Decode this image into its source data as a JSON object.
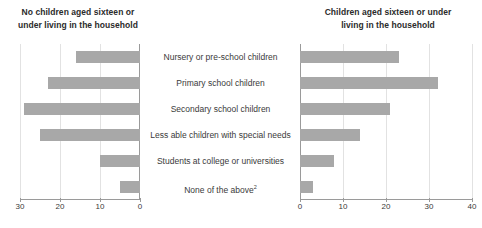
{
  "panels": {
    "left": {
      "title": "No children aged sixteen or under living in the household",
      "title_line1": "No children aged sixteen or",
      "title_line2": "under living in the household",
      "axis_ticks": [
        "30",
        "20",
        "10",
        "0"
      ]
    },
    "right": {
      "title": "Children aged sixteen or under living in the household",
      "title_line1": "Children aged sixteen or under",
      "title_line2": "living in the household",
      "axis_ticks": [
        "0",
        "10",
        "20",
        "30",
        "40"
      ]
    }
  },
  "categories": [
    "Nursery or pre-school children",
    "Primary school children",
    "Secondary school children",
    "Less able children with special needs",
    "Students at college or universities",
    "None of the above"
  ],
  "footnote_marker": "2",
  "colors": {
    "bar": "#a8a8a8",
    "axis": "#9a9a9a",
    "grid": "#e2e2e2",
    "text": "#3a3a3a"
  },
  "chart_data": {
    "type": "bar",
    "title": "Children aged sixteen or under living in the household",
    "orientation": "horizontal",
    "layout": "butterfly-pyramid: two mirrored horizontal bar panels sharing centered category labels",
    "grid": true,
    "legend": "none",
    "categories": [
      "Nursery or pre-school children",
      "Primary school children",
      "Secondary school children",
      "Less able children with special needs",
      "Students at college or universities",
      "None of the above"
    ],
    "series": [
      {
        "name": "No children aged sixteen or under living in the household",
        "panel": "left",
        "axis_direction": "reversed",
        "xlim": [
          0,
          30
        ],
        "xticks": [
          30,
          20,
          10,
          0
        ],
        "values": [
          16,
          23,
          29,
          25,
          10,
          5
        ]
      },
      {
        "name": "Children aged sixteen or under living in the household",
        "panel": "right",
        "axis_direction": "normal",
        "xlim": [
          0,
          40
        ],
        "xticks": [
          0,
          10,
          20,
          30,
          40
        ],
        "values": [
          23,
          32,
          21,
          14,
          8,
          3
        ]
      }
    ],
    "xlabel": "",
    "ylabel": ""
  }
}
